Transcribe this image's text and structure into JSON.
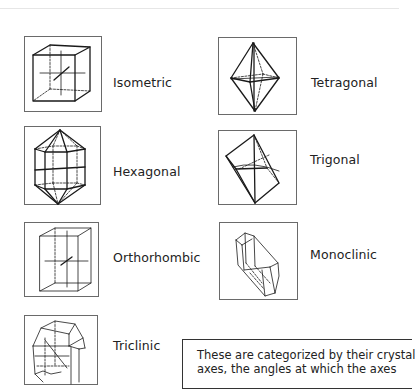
{
  "crystal_systems": [
    {
      "id": "isometric",
      "label": "Isometric",
      "icon": "cube-crystal-icon"
    },
    {
      "id": "tetragonal",
      "label": "Tetragonal",
      "icon": "bipyramid-crystal-icon"
    },
    {
      "id": "hexagonal",
      "label": "Hexagonal",
      "icon": "hexagonal-prism-crystal-icon"
    },
    {
      "id": "trigonal",
      "label": "Trigonal",
      "icon": "rhombohedron-crystal-icon"
    },
    {
      "id": "orthorhombic",
      "label": "Orthorhombic",
      "icon": "rectangular-prism-crystal-icon"
    },
    {
      "id": "monoclinic",
      "label": "Monoclinic",
      "icon": "monoclinic-prism-crystal-icon"
    },
    {
      "id": "triclinic",
      "label": "Triclinic",
      "icon": "triclinic-crystal-icon"
    }
  ],
  "callout": {
    "lines": [
      "These are categorized by their crystal",
      "axes, the angles at which the axes"
    ]
  },
  "colors": {
    "frame_border": "#6a6a6a",
    "line": "#1a1a1a",
    "text": "#222222",
    "background": "#ffffff"
  }
}
